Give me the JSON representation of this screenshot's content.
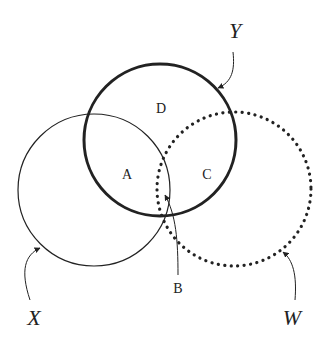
{
  "diagram": {
    "type": "venn",
    "sets": [
      {
        "name": "X",
        "style": "thin-solid"
      },
      {
        "name": "Y",
        "style": "thick-solid"
      },
      {
        "name": "W",
        "style": "dotted"
      }
    ],
    "regions": {
      "A": "A",
      "B": "B",
      "C": "C",
      "D": "D"
    },
    "labels": {
      "X": "X",
      "Y": "Y",
      "W": "W"
    },
    "colors": {
      "stroke": "#222222",
      "background": "#ffffff"
    }
  }
}
